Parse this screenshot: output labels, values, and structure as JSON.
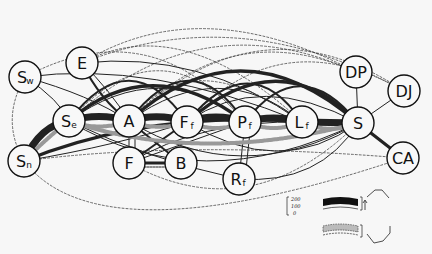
{
  "diagram": {
    "type": "network-flow-diagram",
    "nodes": [
      {
        "id": "Sw",
        "label": "S",
        "sub": "w",
        "x": 25,
        "y": 77
      },
      {
        "id": "E",
        "label": "E",
        "sub": "",
        "x": 82,
        "y": 63
      },
      {
        "id": "Se",
        "label": "S",
        "sub": "e",
        "x": 69,
        "y": 121
      },
      {
        "id": "Sn",
        "label": "S",
        "sub": "n",
        "x": 24,
        "y": 161
      },
      {
        "id": "A",
        "label": "A",
        "sub": "",
        "x": 129,
        "y": 121
      },
      {
        "id": "Ff",
        "label": "F",
        "sub": "f",
        "x": 187,
        "y": 122
      },
      {
        "id": "Pf",
        "label": "P",
        "sub": "f",
        "x": 245,
        "y": 122
      },
      {
        "id": "Lf",
        "label": "L",
        "sub": "f",
        "x": 302,
        "y": 122
      },
      {
        "id": "S",
        "label": "S",
        "sub": "",
        "x": 358,
        "y": 123
      },
      {
        "id": "DP",
        "label": "DP",
        "sub": "",
        "x": 356,
        "y": 72
      },
      {
        "id": "DJ",
        "label": "DJ",
        "sub": "",
        "x": 404,
        "y": 91
      },
      {
        "id": "CA",
        "label": "CA",
        "sub": "",
        "x": 403,
        "y": 158
      },
      {
        "id": "F",
        "label": "F",
        "sub": "",
        "x": 129,
        "y": 163
      },
      {
        "id": "B",
        "label": "B",
        "sub": "",
        "x": 181,
        "y": 163
      },
      {
        "id": "Rf",
        "label": "R",
        "sub": "f",
        "x": 239,
        "y": 179
      }
    ],
    "legend": {
      "scale_values": [
        "200",
        "100",
        "0"
      ],
      "entries": [
        {
          "style": "solid-black-band",
          "direction": "clockwise"
        },
        {
          "style": "hatched-band",
          "direction": "counter-clockwise"
        }
      ]
    }
  }
}
